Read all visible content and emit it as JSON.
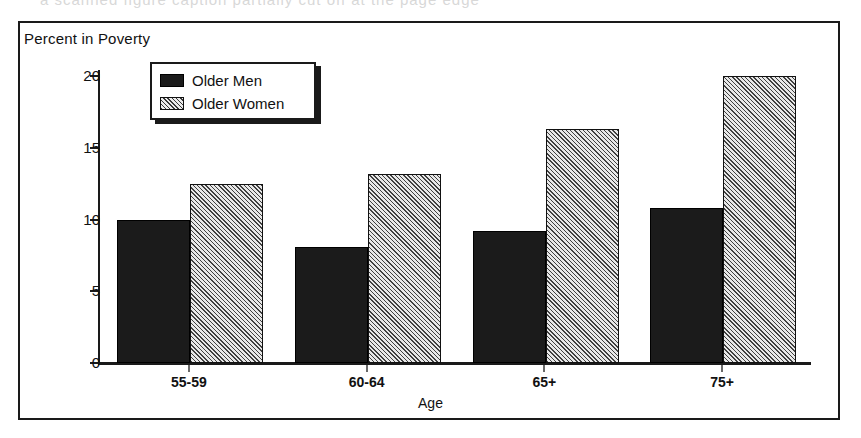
{
  "scan_artifact_text": "a scanned figure caption partially cut off at the page edge",
  "figure": {
    "title": "Percent in Poverty",
    "x_axis_title": "Age"
  },
  "legend": {
    "entries": [
      {
        "label": "Older Men",
        "swatch": "solid-black"
      },
      {
        "label": "Older Women",
        "swatch": "diagonal-hatch"
      }
    ]
  },
  "chart_data": {
    "type": "bar",
    "title": "Percent in Poverty",
    "xlabel": "Age",
    "ylabel": "Percent in Poverty",
    "categories": [
      "55-59",
      "60-64",
      "65+",
      "75+"
    ],
    "series": [
      {
        "name": "Older Men",
        "values": [
          10.0,
          8.1,
          9.2,
          10.8
        ],
        "color": "#1b1b1b",
        "fill": "solid-black"
      },
      {
        "name": "Older Women",
        "values": [
          12.5,
          13.2,
          16.3,
          20.0
        ],
        "color": "#cfcfcf",
        "fill": "diagonal-hatch"
      }
    ],
    "ylim": [
      0,
      21
    ],
    "yticks": [
      0,
      5,
      10,
      15,
      20
    ],
    "ytick_labels": [
      "0",
      "5",
      "10",
      "15",
      "20"
    ],
    "grid": false,
    "legend_position": "upper-left-inside"
  }
}
